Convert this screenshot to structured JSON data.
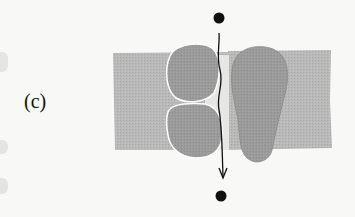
{
  "figure": {
    "panel_label": "(c)",
    "colors": {
      "background": "#f8f8f6",
      "membrane": "#b9b9b9",
      "protein": "#9b9b9b",
      "protein_highlight": "#ffffff",
      "arrow": "#111111",
      "dot": "#111111"
    },
    "elements": {
      "membrane_band": "lipid-bilayer",
      "protein_subunits": [
        "upper-left-subunit",
        "lower-left-subunit",
        "right-subunit"
      ],
      "pathway": "downward-arrow",
      "endpoints": [
        "top-dot",
        "bottom-dot"
      ]
    }
  }
}
